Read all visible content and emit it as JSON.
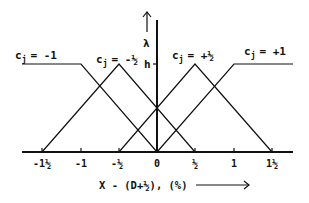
{
  "diagram": {
    "axis": {
      "x_label": "X - (D+½),  (%)",
      "y_label": "λ",
      "h_label": "h",
      "tick_labels": [
        "-1½",
        "-1",
        "-½",
        "0",
        "½",
        "1",
        "1½"
      ]
    },
    "curves": [
      {
        "label": "c",
        "sub": "j",
        "eq": "= -1"
      },
      {
        "label": "c",
        "sub": "j",
        "eq": "= -½"
      },
      {
        "label": "c",
        "sub": "j",
        "eq": "= +½"
      },
      {
        "label": "c",
        "sub": "j",
        "eq": "= +1"
      }
    ],
    "colors": {
      "line": "#111111",
      "background": "#ffffff"
    }
  }
}
